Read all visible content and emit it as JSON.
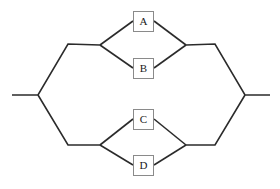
{
  "diagram": {
    "type": "parallel-series-network",
    "background_color": "#ffffff",
    "line_color": "#2b2b2b",
    "box_border_color": "#8a8a8a",
    "box_fill_color": "#ffffff",
    "label_color": "#1a1a1a",
    "nodes": [
      {
        "id": "A",
        "label": "A",
        "x": 133,
        "y": 11,
        "w": 21,
        "h": 21,
        "group": "upper",
        "branch": "top"
      },
      {
        "id": "B",
        "label": "B",
        "x": 133,
        "y": 58,
        "w": 21,
        "h": 21,
        "group": "upper",
        "branch": "bottom"
      },
      {
        "id": "C",
        "label": "C",
        "x": 133,
        "y": 109,
        "w": 21,
        "h": 21,
        "group": "lower",
        "branch": "top"
      },
      {
        "id": "D",
        "label": "D",
        "x": 133,
        "y": 155,
        "w": 21,
        "h": 21,
        "group": "lower",
        "branch": "bottom"
      }
    ],
    "terminals": {
      "left": {
        "stub_start_x": 12,
        "stub_end_x": 38,
        "y": 95
      },
      "right": {
        "stub_start_x": 245,
        "stub_end_x": 270,
        "y": 95
      }
    },
    "vertices": {
      "left_junction": {
        "x": 38,
        "y": 95
      },
      "right_junction": {
        "x": 245,
        "y": 95
      },
      "upper_left_bend": {
        "x": 68,
        "y": 44
      },
      "upper_left_split": {
        "x": 100,
        "y": 45
      },
      "upper_right_merge": {
        "x": 186,
        "y": 45
      },
      "upper_right_bend": {
        "x": 215,
        "y": 44
      },
      "lower_left_bend": {
        "x": 68,
        "y": 145
      },
      "lower_left_split": {
        "x": 100,
        "y": 145
      },
      "lower_right_merge": {
        "x": 186,
        "y": 145
      },
      "lower_right_bend": {
        "x": 215,
        "y": 145
      }
    },
    "paths": {
      "outline_upper_left": "M 12 95 L 38 95 L 68 44 L 100 45",
      "outline_upper_right": "M 186 45 L 215 44 L 245 95 L 270 95",
      "outline_lower_left": "M 38 95 L 68 145 L 100 145",
      "outline_lower_right": "M 186 145 L 215 145 L 245 95",
      "branch_a_in": "M 100 45 L 133 21",
      "branch_a_out": "M 154 21 L 186 45",
      "branch_b_in": "M 100 45 L 133 68",
      "branch_b_out": "M 154 68 L 186 45",
      "branch_c_in": "M 100 145 L 133 119",
      "branch_c_out": "M 154 119 L 186 145",
      "branch_d_in": "M 100 145 L 133 165",
      "branch_d_out": "M 154 165 L 186 145"
    }
  }
}
